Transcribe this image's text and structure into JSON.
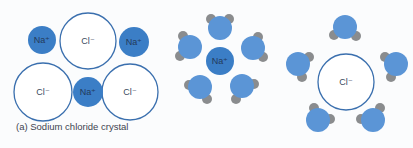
{
  "colors": {
    "sodium_fill": "#3b7ec6",
    "chloride_stroke": "#3a6fae",
    "chloride_fill": "#ffffff",
    "water_oxygen": "#5b95d6",
    "water_hydrogen": "#8a8c8e"
  },
  "crystal": {
    "caption": "(a)  Sodium chloride crystal",
    "ions": [
      {
        "type": "Na",
        "label": "Na⁺",
        "cx": 42,
        "cy": 40,
        "r": 14
      },
      {
        "type": "Cl",
        "label": "Cl⁻",
        "cx": 88,
        "cy": 41,
        "r": 28
      },
      {
        "type": "Na",
        "label": "Na⁺",
        "cx": 134,
        "cy": 42,
        "r": 15
      },
      {
        "type": "Cl",
        "label": "Cl⁻",
        "cx": 43,
        "cy": 92,
        "r": 29
      },
      {
        "type": "Na",
        "label": "Na⁺",
        "cx": 88,
        "cy": 92,
        "r": 15
      },
      {
        "type": "Cl",
        "label": "Cl⁻",
        "cx": 130,
        "cy": 92,
        "r": 28
      }
    ]
  },
  "hydrated_sodium": {
    "ion": {
      "type": "Na",
      "label": "Na⁺",
      "cx": 220,
      "cy": 61,
      "r": 14
    },
    "waters": [
      {
        "cx": 220,
        "cy": 28,
        "h": [
          [
            211,
            19
          ],
          [
            229,
            19
          ]
        ]
      },
      {
        "cx": 190,
        "cy": 47,
        "h": [
          [
            183,
            36
          ],
          [
            180,
            56
          ]
        ]
      },
      {
        "cx": 253,
        "cy": 48,
        "h": [
          [
            258,
            37
          ],
          [
            263,
            57
          ]
        ]
      },
      {
        "cx": 200,
        "cy": 87,
        "h": [
          [
            189,
            85
          ],
          [
            207,
            99
          ]
        ]
      },
      {
        "cx": 242,
        "cy": 86,
        "h": [
          [
            254,
            84
          ],
          [
            236,
            99
          ]
        ]
      }
    ]
  },
  "hydrated_chloride": {
    "ion": {
      "type": "Cl",
      "label": "Cl⁻",
      "cx": 346,
      "cy": 82,
      "r": 28
    },
    "waters": [
      {
        "cx": 345,
        "cy": 27,
        "h": [
          [
            334,
            35
          ],
          [
            356,
            36
          ]
        ]
      },
      {
        "cx": 298,
        "cy": 64,
        "h": [
          [
            309,
            57
          ],
          [
            302,
            77
          ]
        ]
      },
      {
        "cx": 396,
        "cy": 64,
        "h": [
          [
            385,
            57
          ],
          [
            391,
            77
          ]
        ]
      },
      {
        "cx": 318,
        "cy": 120,
        "h": [
          [
            314,
            108
          ],
          [
            330,
            119
          ]
        ]
      },
      {
        "cx": 373,
        "cy": 120,
        "h": [
          [
            361,
            119
          ],
          [
            380,
            108
          ]
        ]
      }
    ]
  }
}
